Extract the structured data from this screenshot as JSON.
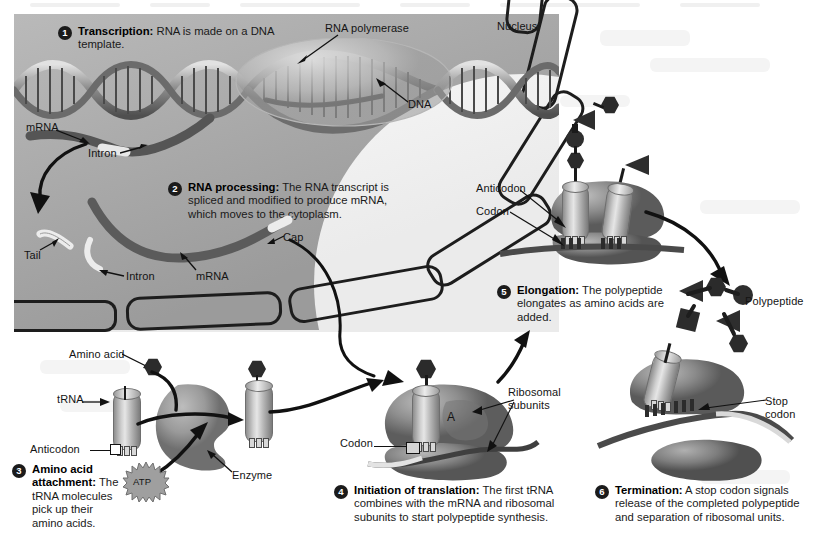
{
  "figure": {
    "background_color": "#ffffff",
    "nucleus_color": "#a9a9a9",
    "ink_color": "#1a1a1a"
  },
  "region_labels": {
    "nucleus": "Nucleus"
  },
  "steps": [
    {
      "number": "1",
      "heading": "Transcription:",
      "body": "RNA is made on a DNA template."
    },
    {
      "number": "2",
      "heading": "RNA processing:",
      "body": "The RNA transcript is spliced and modified to produce mRNA, which moves to the cytoplasm."
    },
    {
      "number": "3",
      "heading": "Amino acid attachment:",
      "body": "The tRNA molecules pick up their amino acids."
    },
    {
      "number": "4",
      "heading": "Initiation of translation:",
      "body": "The first tRNA combines with the mRNA and ribosomal subunits to start polypeptide synthesis."
    },
    {
      "number": "5",
      "heading": "Elongation:",
      "body": "The polypeptide elongates as amino acids are added."
    },
    {
      "number": "6",
      "heading": "Termination:",
      "body": "A stop codon signals release of the completed polypeptide and separation of ribosomal units."
    }
  ],
  "callouts": {
    "rna_polymerase": "RNA polymerase",
    "dna": "DNA",
    "mrna_top": "mRNA",
    "intron_top": "Intron",
    "tail": "Tail",
    "intron_bottom": "Intron",
    "mrna_bottom": "mRNA",
    "cap": "Cap",
    "anticodon_elong": "Anticodon",
    "codon_elong": "Codon",
    "polypeptide": "Polypeptide",
    "amino_acid": "Amino acid",
    "trna": "tRNA",
    "anticodon_trna": "Anticodon",
    "atp": "ATP",
    "enzyme": "Enzyme",
    "codon_init": "Codon",
    "ribosomal_subunits": "Ribosomal subunits",
    "a_site": "A",
    "stop_codon": "Stop codon"
  }
}
